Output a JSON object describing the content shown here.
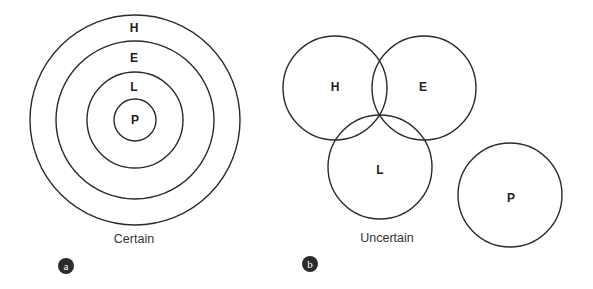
{
  "panels": {
    "a": {
      "badge": "a",
      "caption": "Certain",
      "rings": [
        {
          "label": "H",
          "cx": 135,
          "cy": 120,
          "r": 105
        },
        {
          "label": "E",
          "cx": 135,
          "cy": 120,
          "r": 79
        },
        {
          "label": "L",
          "cx": 135,
          "cy": 120,
          "r": 48
        },
        {
          "label": "P",
          "cx": 135,
          "cy": 120,
          "r": 21
        }
      ],
      "labels": {
        "H": "H",
        "E": "E",
        "L": "L",
        "P": "P"
      }
    },
    "b": {
      "badge": "b",
      "caption": "Uncertain",
      "circles": [
        {
          "label": "H",
          "cx": 335,
          "cy": 88,
          "r": 52
        },
        {
          "label": "E",
          "cx": 424,
          "cy": 88,
          "r": 52
        },
        {
          "label": "L",
          "cx": 380,
          "cy": 167,
          "r": 52
        },
        {
          "label": "P",
          "cx": 510,
          "cy": 195,
          "r": 52
        }
      ],
      "labels": {
        "H": "H",
        "E": "E",
        "L": "L",
        "P": "P"
      }
    }
  },
  "colors": {
    "stroke": "#2a2a2a",
    "text": "#222222",
    "badge": "#2b2b2b",
    "background": "#ffffff"
  }
}
